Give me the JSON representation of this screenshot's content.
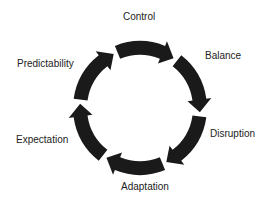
{
  "diagram": {
    "type": "cycle",
    "direction": "clockwise",
    "stages": [
      {
        "label": "Control"
      },
      {
        "label": "Balance"
      },
      {
        "label": "Disruption"
      },
      {
        "label": "Adaptation"
      },
      {
        "label": "Expectation"
      },
      {
        "label": "Predictability"
      }
    ],
    "arrow_color": "#1a1a1a"
  }
}
